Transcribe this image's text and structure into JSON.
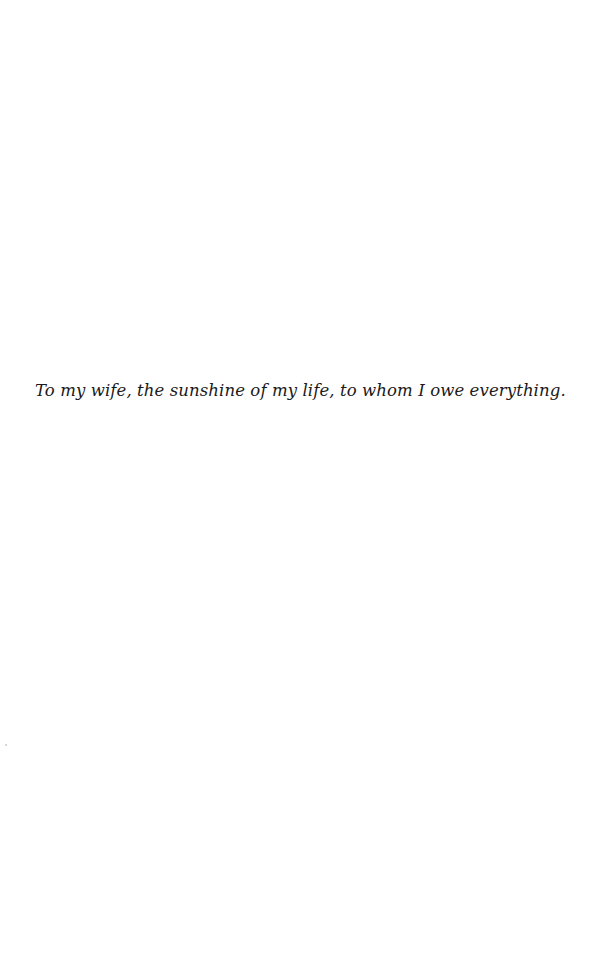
{
  "page": {
    "dedication": "To my wife, the sunshine of my life, to whom I owe everything."
  }
}
